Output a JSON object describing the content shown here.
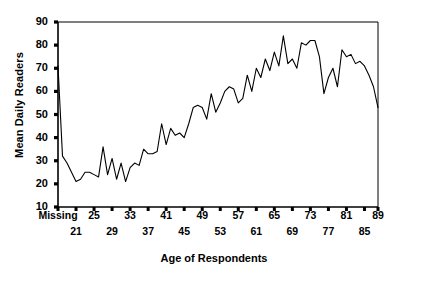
{
  "chart_data": {
    "type": "line",
    "title": "",
    "xlabel": "Age of Respondents",
    "ylabel": "Mean Daily Readers",
    "ylim": [
      10,
      90
    ],
    "ytick_values": [
      10,
      20,
      30,
      40,
      50,
      60,
      70,
      80,
      90
    ],
    "grid": false,
    "legend": null,
    "xtick_labels_row_top": [
      "Missing",
      "25",
      "33",
      "41",
      "49",
      "57",
      "65",
      "73",
      "81",
      "89"
    ],
    "xtick_labels_row_bottom": [
      "21",
      "29",
      "37",
      "45",
      "53",
      "61",
      "69",
      "77",
      "85"
    ],
    "line_color": "#000000",
    "categories": [
      "Missing",
      "19",
      "20",
      "21",
      "22",
      "23",
      "24",
      "25",
      "26",
      "27",
      "28",
      "29",
      "30",
      "31",
      "32",
      "33",
      "34",
      "35",
      "36",
      "37",
      "38",
      "39",
      "40",
      "41",
      "42",
      "43",
      "44",
      "45",
      "46",
      "47",
      "48",
      "49",
      "50",
      "51",
      "52",
      "53",
      "54",
      "55",
      "56",
      "57",
      "58",
      "59",
      "60",
      "61",
      "62",
      "63",
      "64",
      "65",
      "66",
      "67",
      "68",
      "69",
      "70",
      "71",
      "72",
      "73",
      "74",
      "75",
      "76",
      "77",
      "78",
      "79",
      "80",
      "81",
      "82",
      "83",
      "84",
      "85",
      "86",
      "87",
      "88",
      "89"
    ],
    "values": [
      71,
      32,
      29,
      25,
      21,
      22,
      25,
      25,
      24,
      23,
      36,
      24,
      31,
      22,
      29,
      21,
      27,
      29,
      28,
      35,
      33,
      33,
      34,
      46,
      37,
      44,
      41,
      42,
      40,
      46,
      53,
      54,
      53,
      48,
      59,
      51,
      55,
      60,
      62,
      61,
      55,
      57,
      67,
      60,
      70,
      66,
      74,
      69,
      77,
      71,
      84,
      72,
      74,
      70,
      81,
      80,
      82,
      82,
      75,
      59,
      66,
      70,
      62,
      78,
      75,
      76,
      72,
      73,
      71,
      67,
      62,
      53
    ]
  }
}
